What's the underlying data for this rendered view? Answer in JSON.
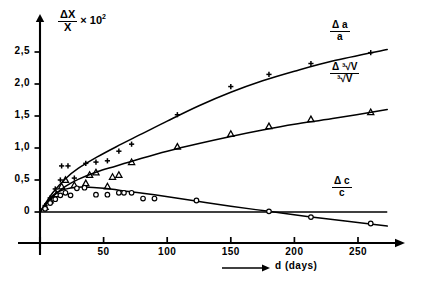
{
  "figure": {
    "background": "#ffffff",
    "ink": "#000000"
  },
  "axes": {
    "y_title": {
      "numerator": "ΔX",
      "denominator": "X",
      "multiplier": "× 10",
      "exponent": "2"
    },
    "x_title": {
      "text": "d (days)",
      "arrow": "—→"
    },
    "y_ticks": [
      "0",
      "0,5",
      "1,0",
      "1,5",
      "2,0",
      "2,5"
    ],
    "y_tick_values": [
      0,
      0.5,
      1.0,
      1.5,
      2.0,
      2.5
    ],
    "x_ticks": [
      "50",
      "100",
      "150",
      "200",
      "250"
    ],
    "x_tick_values": [
      50,
      100,
      150,
      200,
      250
    ]
  },
  "curve_labels": {
    "a": {
      "numerator": "Δ a",
      "denominator": "a"
    },
    "v": {
      "numerator": "Δ ³√V",
      "denominator": "³√V",
      "index": "3",
      "radicand": "V",
      "delta": "Δ"
    },
    "c": {
      "numerator": "Δ c",
      "denominator": "c"
    }
  },
  "chart_data": {
    "type": "scatter",
    "title": "",
    "subtitle": "",
    "xlabel": "d (days)",
    "ylabel": "ΔX/X × 10²",
    "xlim": [
      0,
      273
    ],
    "ylim": [
      -0.35,
      2.72
    ],
    "grid": false,
    "legend_position": "inline-right",
    "annotations": [
      {
        "text": "Δa/a",
        "x": 196,
        "y": 2.5
      },
      {
        "text": "Δ∛ V/∛ V",
        "x": 196,
        "y": 1.88
      },
      {
        "text": "Δc/c",
        "x": 196,
        "y": 0.52
      }
    ],
    "series": [
      {
        "name": "Δa/a",
        "marker": "plus",
        "points": [
          {
            "x": 4,
            "y": 0.1
          },
          {
            "x": 8,
            "y": 0.22
          },
          {
            "x": 12,
            "y": 0.36
          },
          {
            "x": 16,
            "y": 0.5
          },
          {
            "x": 17,
            "y": 0.72
          },
          {
            "x": 22,
            "y": 0.72
          },
          {
            "x": 27,
            "y": 0.53
          },
          {
            "x": 36,
            "y": 0.76
          },
          {
            "x": 44,
            "y": 0.78
          },
          {
            "x": 53,
            "y": 0.8
          },
          {
            "x": 62,
            "y": 0.95
          },
          {
            "x": 72,
            "y": 1.06
          },
          {
            "x": 108,
            "y": 1.52
          },
          {
            "x": 150,
            "y": 1.96
          },
          {
            "x": 180,
            "y": 2.15
          },
          {
            "x": 213,
            "y": 2.32
          },
          {
            "x": 260,
            "y": 2.49
          }
        ],
        "fit": [
          {
            "x": 0,
            "y": 0.0
          },
          {
            "x": 10,
            "y": 0.3
          },
          {
            "x": 20,
            "y": 0.52
          },
          {
            "x": 30,
            "y": 0.68
          },
          {
            "x": 45,
            "y": 0.86
          },
          {
            "x": 60,
            "y": 1.02
          },
          {
            "x": 80,
            "y": 1.22
          },
          {
            "x": 100,
            "y": 1.42
          },
          {
            "x": 125,
            "y": 1.66
          },
          {
            "x": 150,
            "y": 1.87
          },
          {
            "x": 175,
            "y": 2.05
          },
          {
            "x": 200,
            "y": 2.2
          },
          {
            "x": 230,
            "y": 2.36
          },
          {
            "x": 273,
            "y": 2.54
          }
        ]
      },
      {
        "name": "Δ∛V/∛V",
        "marker": "triangle",
        "points": [
          {
            "x": 4,
            "y": 0.08
          },
          {
            "x": 8,
            "y": 0.18
          },
          {
            "x": 13,
            "y": 0.28
          },
          {
            "x": 17,
            "y": 0.4
          },
          {
            "x": 20,
            "y": 0.5
          },
          {
            "x": 27,
            "y": 0.42
          },
          {
            "x": 36,
            "y": 0.45
          },
          {
            "x": 39,
            "y": 0.58
          },
          {
            "x": 44,
            "y": 0.62
          },
          {
            "x": 53,
            "y": 0.4
          },
          {
            "x": 57,
            "y": 0.55
          },
          {
            "x": 62,
            "y": 0.58
          },
          {
            "x": 72,
            "y": 0.78
          },
          {
            "x": 108,
            "y": 1.02
          },
          {
            "x": 150,
            "y": 1.22
          },
          {
            "x": 180,
            "y": 1.34
          },
          {
            "x": 213,
            "y": 1.45
          },
          {
            "x": 260,
            "y": 1.56
          }
        ],
        "fit": [
          {
            "x": 0,
            "y": 0.0
          },
          {
            "x": 10,
            "y": 0.24
          },
          {
            "x": 20,
            "y": 0.4
          },
          {
            "x": 30,
            "y": 0.51
          },
          {
            "x": 45,
            "y": 0.63
          },
          {
            "x": 60,
            "y": 0.72
          },
          {
            "x": 80,
            "y": 0.84
          },
          {
            "x": 100,
            "y": 0.95
          },
          {
            "x": 125,
            "y": 1.07
          },
          {
            "x": 150,
            "y": 1.18
          },
          {
            "x": 175,
            "y": 1.28
          },
          {
            "x": 200,
            "y": 1.37
          },
          {
            "x": 230,
            "y": 1.46
          },
          {
            "x": 273,
            "y": 1.6
          }
        ]
      },
      {
        "name": "Δc/c",
        "marker": "circle",
        "points": [
          {
            "x": 4,
            "y": 0.05
          },
          {
            "x": 8,
            "y": 0.14
          },
          {
            "x": 12,
            "y": 0.2
          },
          {
            "x": 16,
            "y": 0.26
          },
          {
            "x": 20,
            "y": 0.3
          },
          {
            "x": 24,
            "y": 0.26
          },
          {
            "x": 29,
            "y": 0.37
          },
          {
            "x": 35,
            "y": 0.38
          },
          {
            "x": 44,
            "y": 0.27
          },
          {
            "x": 53,
            "y": 0.27
          },
          {
            "x": 62,
            "y": 0.3
          },
          {
            "x": 66,
            "y": 0.3
          },
          {
            "x": 72,
            "y": 0.3
          },
          {
            "x": 81,
            "y": 0.21
          },
          {
            "x": 90,
            "y": 0.21
          },
          {
            "x": 123,
            "y": 0.18
          },
          {
            "x": 180,
            "y": 0.01
          },
          {
            "x": 213,
            "y": -0.08
          },
          {
            "x": 260,
            "y": -0.18
          }
        ],
        "fit": [
          {
            "x": 0,
            "y": 0.0
          },
          {
            "x": 8,
            "y": 0.22
          },
          {
            "x": 16,
            "y": 0.33
          },
          {
            "x": 25,
            "y": 0.38
          },
          {
            "x": 35,
            "y": 0.39
          },
          {
            "x": 50,
            "y": 0.37
          },
          {
            "x": 70,
            "y": 0.32
          },
          {
            "x": 90,
            "y": 0.27
          },
          {
            "x": 120,
            "y": 0.18
          },
          {
            "x": 150,
            "y": 0.09
          },
          {
            "x": 180,
            "y": 0.01
          },
          {
            "x": 210,
            "y": -0.07
          },
          {
            "x": 240,
            "y": -0.14
          },
          {
            "x": 273,
            "y": -0.22
          }
        ]
      }
    ],
    "zero_line": {
      "y": 0,
      "x_from": 0,
      "x_to": 273
    }
  }
}
